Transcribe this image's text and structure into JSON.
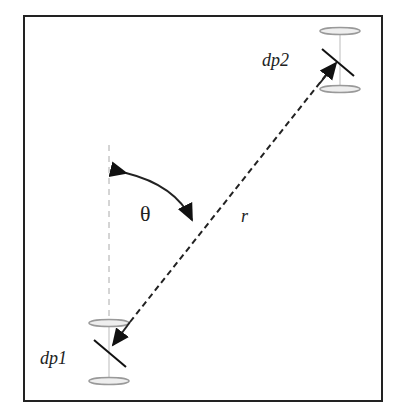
{
  "diagram": {
    "labels": {
      "dipole1": "dp1",
      "dipole2": "dp2",
      "angle": "θ",
      "distance": "r"
    },
    "colors": {
      "frame": "#222222",
      "line": "#222222",
      "ellipse": "#999999",
      "axis": "#aaaaaa"
    }
  }
}
